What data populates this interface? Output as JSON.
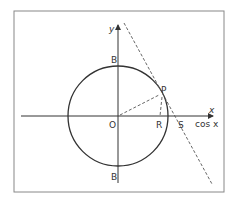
{
  "diagram": {
    "frame": {
      "x": 14,
      "y": 11,
      "width": 210,
      "height": 181
    },
    "origin": {
      "x": 118,
      "y": 116
    },
    "circle_radius": 50,
    "axes": {
      "x_axis_label": "x",
      "x_axis_secondary_label": "cos x",
      "y_axis_label": "y"
    },
    "points": {
      "top": "B",
      "bottom": "B",
      "origin": "O",
      "P": "P",
      "R": "R",
      "S": "S"
    },
    "colors": {
      "stroke": "#333333",
      "dashed": "#555555",
      "frame": "#888888"
    }
  }
}
